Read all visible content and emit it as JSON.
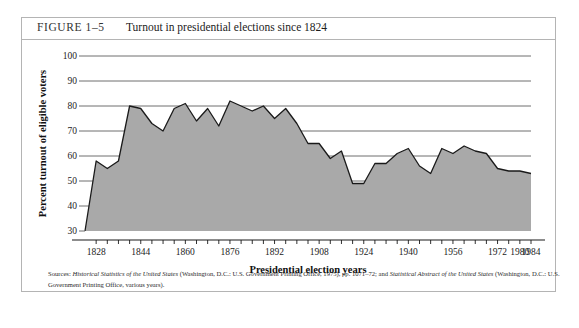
{
  "figure": {
    "number": "FIGURE 1–5",
    "title": "Turnout in presidential elections since 1824"
  },
  "source": {
    "label": "Sources:",
    "text_part1": "Historical Statistics of the United States",
    "text_part2": " (Washington, D.C.: U.S. Government Printing Office, 1975), pp. 1071–72; and ",
    "text_part3": "Statistical Abstract of the United States",
    "text_part4": " (Washington, D.C.: U.S. Government Printing Office, various years)."
  },
  "chart_data": {
    "type": "area",
    "title": "Turnout in presidential elections since 1824",
    "xlabel": "Presidential election years",
    "ylabel": "Percent turnout of eligible voters",
    "xlim": [
      1824,
      1984
    ],
    "ylim": [
      30,
      100
    ],
    "ytick_values": [
      30,
      40,
      50,
      60,
      70,
      80,
      90,
      100
    ],
    "ytick_labels": [
      "30",
      "40",
      "50",
      "60",
      "70",
      "80",
      "90",
      "100"
    ],
    "xtick_values": [
      1828,
      1844,
      1860,
      1876,
      1892,
      1908,
      1924,
      1940,
      1956,
      1972,
      1980,
      1984
    ],
    "xtick_labels": [
      "1828",
      "1844",
      "1860",
      "1876",
      "1892",
      "1908",
      "1924",
      "1940",
      "1956",
      "1972",
      "1980",
      "1984"
    ],
    "minor_xtick_step": 4,
    "grid": "horizontal",
    "legend": "none",
    "fill_color": "#a9a9a9",
    "line_color": "#1a1a1a",
    "grid_color": "#6e6e6e",
    "x": [
      1824,
      1828,
      1832,
      1836,
      1840,
      1844,
      1848,
      1852,
      1856,
      1860,
      1864,
      1868,
      1872,
      1876,
      1880,
      1884,
      1888,
      1892,
      1896,
      1900,
      1904,
      1908,
      1912,
      1916,
      1920,
      1924,
      1928,
      1932,
      1936,
      1940,
      1944,
      1948,
      1952,
      1956,
      1960,
      1964,
      1968,
      1972,
      1976,
      1980,
      1984
    ],
    "y": [
      30,
      58,
      55,
      58,
      80,
      79,
      73,
      70,
      79,
      81,
      74,
      79,
      72,
      82,
      80,
      78,
      80,
      75,
      79,
      73,
      65,
      65,
      59,
      62,
      49,
      49,
      57,
      57,
      61,
      63,
      56,
      53,
      63,
      61,
      64,
      62,
      61,
      55,
      54,
      54,
      53
    ]
  }
}
